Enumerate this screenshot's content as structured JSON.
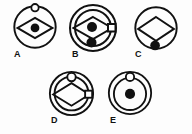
{
  "sheet": {
    "name": "multiple-choice-figure-options",
    "background_color": "#fdfdfd",
    "stroke_color": "#111111",
    "fill_color": "#111111",
    "width": 192,
    "height": 134
  },
  "options": [
    {
      "id": "A",
      "label": "A",
      "left": 12,
      "top": 4,
      "size": 46,
      "label_left": 14,
      "label_top": 50,
      "rings": 1,
      "shapes": [
        "outer-circle",
        "diamond-outline",
        "center-filled-dot",
        "top-hollow-circle"
      ],
      "has_diamond": true,
      "diamond_filled": false,
      "center_dot": "filled",
      "top_marker": "hollow-circle",
      "bottom_marker": "none",
      "right_marker": "none"
    },
    {
      "id": "B",
      "label": "B",
      "left": 68,
      "top": 3,
      "size": 50,
      "label_left": 72,
      "label_top": 50,
      "rings": 2,
      "shapes": [
        "outer-circle",
        "inner-circle",
        "diamond-outline",
        "center-filled-dot",
        "bottom-filled-dot",
        "right-small-square"
      ],
      "has_diamond": true,
      "diamond_filled": false,
      "center_dot": "filled",
      "top_marker": "none",
      "bottom_marker": "filled-dot",
      "right_marker": "small-square"
    },
    {
      "id": "C",
      "label": "C",
      "left": 133,
      "top": 5,
      "size": 46,
      "label_left": 135,
      "label_top": 50,
      "rings": 1,
      "shapes": [
        "outer-circle",
        "diamond-outline",
        "bottom-filled-dot"
      ],
      "has_diamond": true,
      "diamond_filled": false,
      "center_dot": "none",
      "top_marker": "none",
      "bottom_marker": "filled-dot",
      "right_marker": "none"
    },
    {
      "id": "D",
      "label": "D",
      "left": 48,
      "top": 70,
      "size": 47,
      "label_left": 51,
      "label_top": 116,
      "rings": 2,
      "shapes": [
        "outer-circle",
        "inner-circle",
        "diamond-outline",
        "top-hollow-circle",
        "right-small-square"
      ],
      "has_diamond": true,
      "diamond_filled": false,
      "center_dot": "none",
      "top_marker": "hollow-circle",
      "bottom_marker": "none",
      "right_marker": "small-square"
    },
    {
      "id": "E",
      "label": "E",
      "left": 107,
      "top": 70,
      "size": 46,
      "label_left": 110,
      "label_top": 116,
      "rings": 2,
      "shapes": [
        "outer-circle",
        "inner-circle",
        "center-filled-dot",
        "top-hollow-circle"
      ],
      "has_diamond": false,
      "diamond_filled": false,
      "center_dot": "filled",
      "top_marker": "hollow-circle",
      "bottom_marker": "none",
      "right_marker": "none"
    }
  ]
}
